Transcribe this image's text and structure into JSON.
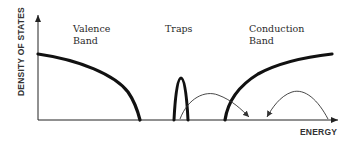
{
  "diagram": {
    "type": "density-of-states",
    "y_axis_label": "DENSITY OF STATES",
    "x_axis_label": "ENERGY",
    "regions": {
      "valence": {
        "line1": "Valence",
        "line2": "Band"
      },
      "traps": {
        "line1": "Traps"
      },
      "conduction": {
        "line1": "Conduction",
        "line2": "Band"
      }
    },
    "arrows": [
      {
        "name": "trap-to-gap-transition",
        "description": "from trap state into gap region toward conduction band edge"
      },
      {
        "name": "conduction-to-gap-transition",
        "description": "from conduction band down into gap region"
      }
    ],
    "colors": {
      "curve": "#111111",
      "axis": "#222222",
      "arrow": "#333333",
      "text": "#2a2a2a"
    }
  }
}
